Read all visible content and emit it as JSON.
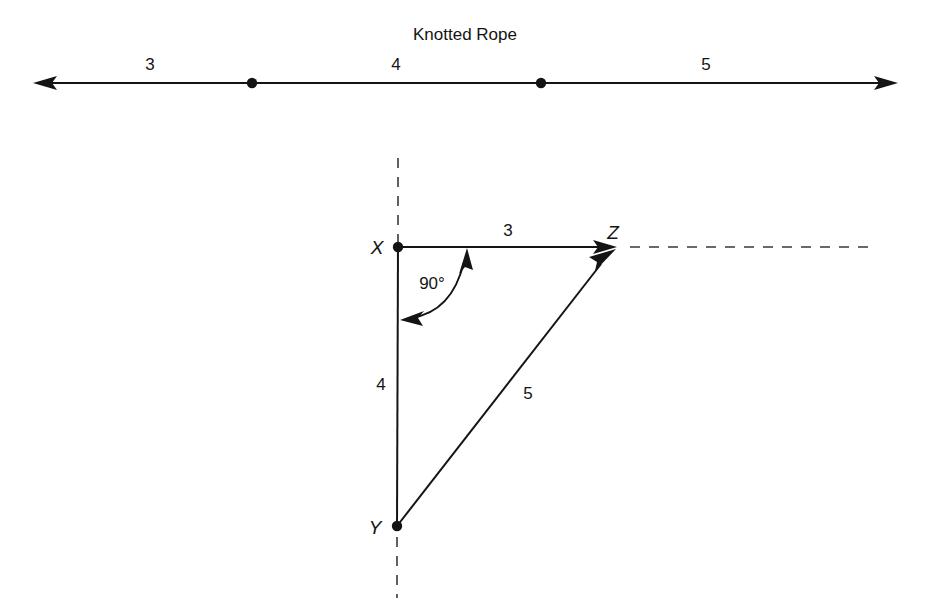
{
  "figure": {
    "background_color": "#ffffff",
    "ink_color": "#141414",
    "width": 931,
    "height": 598
  },
  "rope": {
    "title": "Knotted Rope",
    "segment_labels": [
      "3",
      "4",
      "5"
    ],
    "knot_count": 2,
    "line": {
      "y": 83,
      "x_start": 33,
      "x_end": 898,
      "left_arrow": true,
      "right_arrow": true
    },
    "knots": [
      {
        "label": "knot-1",
        "x": 252,
        "y": 83
      },
      {
        "label": "knot-2",
        "x": 541,
        "y": 83
      }
    ],
    "label_positions": [
      {
        "text": "3",
        "x": 150,
        "y": 70
      },
      {
        "text": "4",
        "x": 396,
        "y": 70
      },
      {
        "text": "5",
        "x": 706,
        "y": 70
      }
    ],
    "title_position": {
      "x": 465,
      "y": 40
    }
  },
  "triangle": {
    "vertices": [
      {
        "name": "X",
        "x": 398,
        "y": 247
      },
      {
        "name": "Y",
        "x": 397,
        "y": 526
      },
      {
        "name": "Z",
        "x": 617,
        "y": 247
      }
    ],
    "vertex_labels": [
      "X",
      "Y",
      "Z"
    ],
    "side_labels": [
      {
        "text": "3",
        "side": "XZ",
        "x": 508,
        "y": 236
      },
      {
        "text": "4",
        "side": "XY",
        "x": 381,
        "y": 390
      },
      {
        "text": "5",
        "side": "YZ",
        "x": 528,
        "y": 399
      }
    ],
    "angle_label": "90°",
    "angle_label_position": {
      "x": 432,
      "y": 289
    },
    "angle_vertex": "X",
    "reference_lines": [
      {
        "name": "vertical-dashed-above-x",
        "x1": 398,
        "y1": 158,
        "x2": 398,
        "y2": 247
      },
      {
        "name": "vertical-dashed-below-y",
        "x1": 397,
        "y1": 536,
        "x2": 397,
        "y2": 598
      },
      {
        "name": "horizontal-dashed-right-of-z",
        "x1": 627,
        "y1": 247,
        "x2": 874,
        "y2": 247
      }
    ],
    "arrows": [
      {
        "name": "xz-arrow",
        "from": "X",
        "to": "Z"
      },
      {
        "name": "yz-arrow",
        "from": "Y",
        "to": "Z"
      }
    ]
  }
}
